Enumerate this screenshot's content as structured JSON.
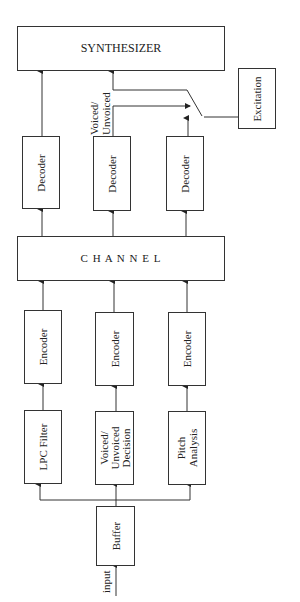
{
  "diagram": {
    "boxes": {
      "synthesizer": "SYNTHESIZER",
      "excitation": "Excitation",
      "channel": "C H A N N E L",
      "decoder_1": "Decoder",
      "decoder_2": "Decoder",
      "decoder_3": "Decoder",
      "encoder_1": "Encoder",
      "encoder_2": "Encoder",
      "encoder_3": "Encoder",
      "lpc_filter": "LPC Filter",
      "vuv_decision_line1": "Voiced/",
      "vuv_decision_line2": "Unvoiced",
      "vuv_decision_line3": "Decision",
      "pitch_line1": "Pitch",
      "pitch_line2": "Analysis",
      "buffer": "Buffer"
    },
    "labels": {
      "vuv_line1": "Voiced/",
      "vuv_line2": "Unvoiced",
      "input": "input"
    },
    "colors": {
      "line": "#333333",
      "background": "#ffffff"
    }
  }
}
